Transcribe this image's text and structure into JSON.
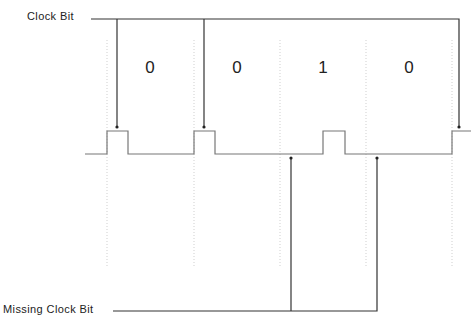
{
  "diagram": {
    "type": "timing-diagram",
    "labels": {
      "clock_bit": "Clock Bit",
      "missing_clock_bit": "Missing Clock Bit"
    },
    "bits": [
      {
        "value": "0",
        "x": 150
      },
      {
        "value": "0",
        "x": 237
      },
      {
        "value": "1",
        "x": 323
      },
      {
        "value": "0",
        "x": 409
      }
    ],
    "cell_boundaries_x": [
      107,
      194,
      280,
      366,
      452
    ],
    "waveform": {
      "baseline_y": 154,
      "high_y": 131,
      "start_x": 85,
      "end_x": 471,
      "pulses": [
        {
          "x1": 107,
          "x2": 128,
          "kind": "clock"
        },
        {
          "x1": 194,
          "x2": 215,
          "kind": "clock"
        },
        {
          "x1": 323,
          "x2": 345,
          "kind": "data"
        },
        {
          "x1": 452,
          "x2": 471,
          "kind": "clock"
        }
      ]
    },
    "clock_bit_arrows_x": [
      117,
      204,
      459
    ],
    "missing_clock_bit_arrows_x": [
      291,
      377
    ],
    "colors": {
      "line": "#333333",
      "signal": "#777777",
      "grid": "#cfcfcf",
      "text": "#222222"
    }
  }
}
